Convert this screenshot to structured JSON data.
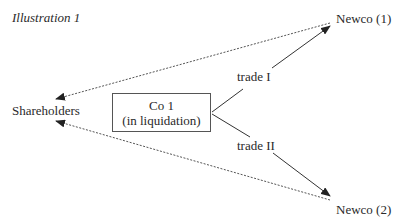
{
  "title": "Illustration 1",
  "nodes": {
    "shareholders": "Shareholders",
    "company": {
      "line1": "Co 1",
      "line2": "(in liquidation)"
    },
    "newco1": "Newco (1)",
    "newco2": "Newco (2)"
  },
  "edges": {
    "trade1_label": "trade I",
    "trade2_label": "trade II"
  },
  "colors": {
    "line": "#2a2a2a",
    "dashed": "#555555",
    "background": "#ffffff"
  }
}
